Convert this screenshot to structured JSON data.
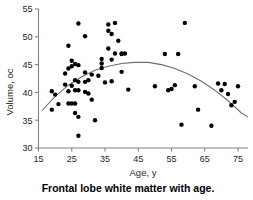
{
  "chart_data": {
    "type": "scatter",
    "title": "",
    "caption": "Frontal lobe white matter with age.",
    "xlabel": "Age, y",
    "ylabel": "Volume, oc",
    "xlim": [
      15,
      78
    ],
    "ylim": [
      30,
      55
    ],
    "xticks": [
      15,
      25,
      35,
      45,
      55,
      65,
      75
    ],
    "xticklabels": [
      "15",
      "25",
      "35",
      "45",
      "55",
      "65",
      "75"
    ],
    "yticks": [
      30,
      35,
      40,
      45,
      50,
      55
    ],
    "yticklabels": [
      "30",
      "35",
      "40",
      "45",
      "50",
      "55"
    ],
    "grid": false,
    "legend": false,
    "marker_color": "#000000",
    "fit_color": "#6d6e71",
    "axis_color": "#808285",
    "fit_curve": {
      "kind": "quadratic",
      "description": "downward-opening parabola peaking near age 46 at about 45.4",
      "vertex_x": 46,
      "vertex_y": 45.4,
      "x_start": 16,
      "y_start": 36.7,
      "x_end": 78,
      "y_end": 35.6,
      "sample_points": [
        [
          16,
          36.7
        ],
        [
          20,
          39.3
        ],
        [
          24,
          41.3
        ],
        [
          28,
          42.8
        ],
        [
          32,
          44.0
        ],
        [
          36,
          44.7
        ],
        [
          40,
          45.2
        ],
        [
          44,
          45.4
        ],
        [
          48,
          45.4
        ],
        [
          52,
          45.0
        ],
        [
          56,
          44.3
        ],
        [
          60,
          43.3
        ],
        [
          64,
          42.0
        ],
        [
          68,
          40.4
        ],
        [
          72,
          38.5
        ],
        [
          76,
          36.3
        ],
        [
          78,
          35.6
        ]
      ]
    },
    "points": [
      [
        19,
        40.2
      ],
      [
        19,
        36.9
      ],
      [
        20,
        39.6
      ],
      [
        21,
        37.9
      ],
      [
        23,
        43.4
      ],
      [
        23,
        41.4
      ],
      [
        24,
        48.4
      ],
      [
        24,
        44.3
      ],
      [
        24,
        40.2
      ],
      [
        24,
        38.0
      ],
      [
        25,
        45.7
      ],
      [
        25,
        44.7
      ],
      [
        25,
        41.2
      ],
      [
        25,
        38.0
      ],
      [
        26,
        45.1
      ],
      [
        26,
        42.2
      ],
      [
        26,
        40.4
      ],
      [
        26,
        38.0
      ],
      [
        26,
        36.3
      ],
      [
        27,
        52.4
      ],
      [
        27,
        44.9
      ],
      [
        27,
        41.9
      ],
      [
        27,
        40.4
      ],
      [
        27,
        35.6
      ],
      [
        27,
        32.2
      ],
      [
        29,
        50.1
      ],
      [
        29,
        43.6
      ],
      [
        29,
        41.9
      ],
      [
        29,
        40.1
      ],
      [
        30,
        42.2
      ],
      [
        30,
        39.8
      ],
      [
        31,
        43.2
      ],
      [
        31,
        38.7
      ],
      [
        32,
        35.0
      ],
      [
        33,
        43.0
      ],
      [
        34,
        46.0
      ],
      [
        34,
        45.2
      ],
      [
        34,
        44.4
      ],
      [
        35,
        41.8
      ],
      [
        36,
        52.2
      ],
      [
        36,
        51.1
      ],
      [
        36,
        47.9
      ],
      [
        37,
        50.5
      ],
      [
        37,
        45.9
      ],
      [
        37,
        42.0
      ],
      [
        38,
        52.5
      ],
      [
        38,
        47.0
      ],
      [
        39,
        49.3
      ],
      [
        40,
        47.0
      ],
      [
        40,
        46.9
      ],
      [
        40,
        43.7
      ],
      [
        41,
        47.0
      ],
      [
        42,
        40.5
      ],
      [
        50,
        41.1
      ],
      [
        53,
        46.9
      ],
      [
        54,
        40.4
      ],
      [
        55,
        40.6
      ],
      [
        56,
        41.3
      ],
      [
        57,
        46.9
      ],
      [
        58,
        34.2
      ],
      [
        59,
        52.5
      ],
      [
        62,
        41.1
      ],
      [
        63,
        36.9
      ],
      [
        67,
        34.0
      ],
      [
        69,
        41.6
      ],
      [
        70,
        40.4
      ],
      [
        71,
        41.5
      ],
      [
        72,
        39.7
      ],
      [
        73,
        37.7
      ],
      [
        74,
        38.3
      ],
      [
        75,
        41.1
      ]
    ]
  }
}
